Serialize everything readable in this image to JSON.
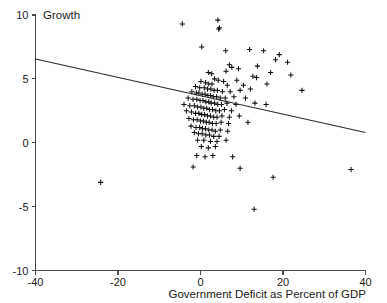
{
  "chart_data": {
    "type": "scatter",
    "title": "",
    "xlabel": "Government Deficit as Percent of GDP",
    "ylabel": "Growth",
    "xlim": [
      -40,
      40
    ],
    "ylim": [
      -10,
      10
    ],
    "xticks": [
      -40,
      -20,
      0,
      20,
      40
    ],
    "yticks": [
      10,
      5,
      0,
      -5,
      -10
    ],
    "xtick_labels": [
      "-40",
      "-20",
      "0",
      "20",
      "40"
    ],
    "ytick_labels": [
      "10",
      "5",
      "0",
      "-5",
      "-10"
    ],
    "grid": false,
    "legend": "none",
    "marker": "plus",
    "marker_color": "#111111",
    "axis_color": "#4a4a4a",
    "trendline": {
      "name": "linear fit",
      "x_start": -40,
      "y_start": 6.55,
      "x_end": 40,
      "y_end": 0.8,
      "slope": -0.0719,
      "intercept": 3.675,
      "color": "#2a2a2a"
    },
    "points": [
      [
        -24.2,
        -3.1
      ],
      [
        -4.4,
        9.3
      ],
      [
        4.2,
        9.6
      ],
      [
        4.6,
        9.0
      ],
      [
        4.4,
        8.9
      ],
      [
        11.9,
        7.3
      ],
      [
        0.3,
        7.5
      ],
      [
        6.1,
        7.2
      ],
      [
        15.3,
        7.2
      ],
      [
        19.1,
        6.9
      ],
      [
        18.2,
        6.5
      ],
      [
        21.1,
        6.3
      ],
      [
        7.0,
        6.1
      ],
      [
        7.6,
        5.9
      ],
      [
        9.2,
        5.8
      ],
      [
        13.8,
        6.0
      ],
      [
        6.2,
        5.6
      ],
      [
        1.9,
        5.5
      ],
      [
        2.7,
        5.4
      ],
      [
        17.0,
        5.5
      ],
      [
        21.9,
        5.3
      ],
      [
        12.7,
        5.2
      ],
      [
        13.6,
        5.1
      ],
      [
        3.4,
        5.0
      ],
      [
        4.3,
        4.9
      ],
      [
        5.6,
        4.8
      ],
      [
        8.8,
        4.9
      ],
      [
        0.1,
        4.8
      ],
      [
        1.2,
        4.7
      ],
      [
        2.0,
        4.6
      ],
      [
        2.8,
        4.6
      ],
      [
        6.5,
        4.5
      ],
      [
        10.4,
        4.5
      ],
      [
        16.1,
        4.6
      ],
      [
        -1.2,
        4.4
      ],
      [
        -0.2,
        4.3
      ],
      [
        0.9,
        4.3
      ],
      [
        1.7,
        4.2
      ],
      [
        2.5,
        4.2
      ],
      [
        3.3,
        4.1
      ],
      [
        4.1,
        4.1
      ],
      [
        5.3,
        4.0
      ],
      [
        7.2,
        4.0
      ],
      [
        9.6,
        4.1
      ],
      [
        12.1,
        4.2
      ],
      [
        24.6,
        4.1
      ],
      [
        -2.1,
        4.0
      ],
      [
        -1.0,
        3.9
      ],
      [
        -0.4,
        3.9
      ],
      [
        0.4,
        3.8
      ],
      [
        1.1,
        3.8
      ],
      [
        1.8,
        3.7
      ],
      [
        2.4,
        3.7
      ],
      [
        3.1,
        3.6
      ],
      [
        3.9,
        3.6
      ],
      [
        4.8,
        3.5
      ],
      [
        6.0,
        3.5
      ],
      [
        8.1,
        3.6
      ],
      [
        10.9,
        3.5
      ],
      [
        -3.0,
        3.5
      ],
      [
        -1.8,
        3.4
      ],
      [
        -0.9,
        3.4
      ],
      [
        -0.1,
        3.3
      ],
      [
        0.6,
        3.3
      ],
      [
        1.3,
        3.2
      ],
      [
        2.0,
        3.2
      ],
      [
        2.6,
        3.1
      ],
      [
        3.4,
        3.1
      ],
      [
        4.2,
        3.0
      ],
      [
        5.1,
        3.0
      ],
      [
        6.4,
        3.1
      ],
      [
        8.6,
        3.0
      ],
      [
        13.2,
        3.1
      ],
      [
        15.9,
        3.0
      ],
      [
        -4.0,
        3.0
      ],
      [
        -2.6,
        2.9
      ],
      [
        -1.5,
        2.9
      ],
      [
        -0.7,
        2.8
      ],
      [
        0.1,
        2.8
      ],
      [
        0.8,
        2.7
      ],
      [
        1.5,
        2.7
      ],
      [
        2.2,
        2.6
      ],
      [
        2.9,
        2.6
      ],
      [
        3.7,
        2.5
      ],
      [
        4.6,
        2.5
      ],
      [
        5.8,
        2.6
      ],
      [
        7.5,
        2.5
      ],
      [
        -3.4,
        2.5
      ],
      [
        -2.2,
        2.4
      ],
      [
        -1.2,
        2.3
      ],
      [
        -0.4,
        2.3
      ],
      [
        0.3,
        2.2
      ],
      [
        1.0,
        2.2
      ],
      [
        1.7,
        2.1
      ],
      [
        2.4,
        2.1
      ],
      [
        3.2,
        2.0
      ],
      [
        4.0,
        2.0
      ],
      [
        5.2,
        2.1
      ],
      [
        7.0,
        2.0
      ],
      [
        9.4,
        2.1
      ],
      [
        -2.8,
        1.9
      ],
      [
        -1.7,
        1.8
      ],
      [
        -0.8,
        1.8
      ],
      [
        0.0,
        1.7
      ],
      [
        0.7,
        1.7
      ],
      [
        1.4,
        1.6
      ],
      [
        2.1,
        1.6
      ],
      [
        2.9,
        1.5
      ],
      [
        3.8,
        1.5
      ],
      [
        5.0,
        1.6
      ],
      [
        6.8,
        1.5
      ],
      [
        11.5,
        1.6
      ],
      [
        -2.3,
        1.3
      ],
      [
        -1.1,
        1.2
      ],
      [
        -0.2,
        1.2
      ],
      [
        0.5,
        1.1
      ],
      [
        1.2,
        1.1
      ],
      [
        2.0,
        1.0
      ],
      [
        2.8,
        1.0
      ],
      [
        3.6,
        0.9
      ],
      [
        4.8,
        1.0
      ],
      [
        6.6,
        0.9
      ],
      [
        -1.5,
        0.8
      ],
      [
        -0.5,
        0.7
      ],
      [
        0.4,
        0.7
      ],
      [
        1.3,
        0.6
      ],
      [
        2.2,
        0.6
      ],
      [
        3.2,
        0.5
      ],
      [
        4.5,
        0.5
      ],
      [
        -0.7,
        0.2
      ],
      [
        0.8,
        0.2
      ],
      [
        2.4,
        0.1
      ],
      [
        4.0,
        0.1
      ],
      [
        6.2,
        0.2
      ],
      [
        0.2,
        -0.3
      ],
      [
        1.9,
        -0.4
      ],
      [
        3.6,
        -0.3
      ],
      [
        -0.9,
        -1.0
      ],
      [
        1.1,
        -1.1
      ],
      [
        3.0,
        -1.0
      ],
      [
        7.8,
        -1.1
      ],
      [
        -1.8,
        -1.9
      ],
      [
        9.6,
        -2.0
      ],
      [
        17.6,
        -2.7
      ],
      [
        36.5,
        -2.1
      ],
      [
        13.0,
        -5.2
      ]
    ]
  }
}
